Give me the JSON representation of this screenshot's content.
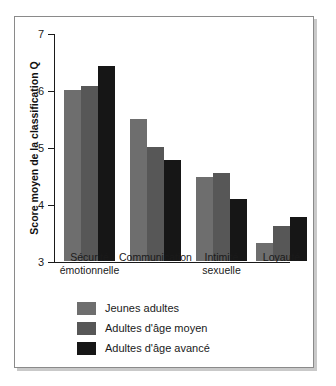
{
  "chart_data": {
    "type": "bar",
    "title": "",
    "xlabel": "",
    "ylabel": "Score moyen de la classification Q",
    "ylim": [
      3,
      7
    ],
    "yticks": [
      3,
      4,
      5,
      6,
      7
    ],
    "ytick_labels": [
      "3",
      "4",
      "5",
      "6",
      "7"
    ],
    "grid": false,
    "legend_position": "bottom-left",
    "categories": [
      "Sécurité\némotionnelle",
      "Communication",
      "Intimité\nsexuelle",
      "Loyauté"
    ],
    "series": [
      {
        "name": "Jeunes adultes",
        "color": "#6e6e6e",
        "values": [
          6.0,
          5.5,
          4.48,
          3.32
        ]
      },
      {
        "name": "Adultes d'âge moyen",
        "color": "#575757",
        "values": [
          6.07,
          5.0,
          4.55,
          3.62
        ]
      },
      {
        "name": "Adultes d'âge avancé",
        "color": "#161616",
        "values": [
          6.42,
          4.77,
          4.08,
          3.77
        ]
      }
    ]
  },
  "legend": {
    "items": [
      {
        "label": "Jeunes adultes"
      },
      {
        "label": "Adultes d'âge moyen"
      },
      {
        "label": "Adultes d'âge avancé"
      }
    ]
  },
  "axis": {
    "y_title": "Score moyen de la classification Q"
  }
}
